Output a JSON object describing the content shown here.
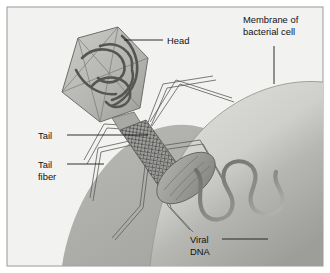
{
  "figure": {
    "background_color": "#f2f2f1",
    "border_color": "#9a9a98",
    "ink_color": "#111111"
  },
  "labels": {
    "head": "Head",
    "membrane_line1": "Membrane of",
    "membrane_line2": "bacterial cell",
    "tail": "Tail",
    "tail_fiber_line1": "Tail",
    "tail_fiber_line2": "fiber",
    "viral_dna_line1": "Viral",
    "viral_dna_line2": "DNA"
  },
  "parts": {
    "head_name": "icosahedral-capsid",
    "head_fill": "#b9b9b6",
    "head_edge": "#6d6d6a",
    "packed_dna_color": "#555553",
    "collar_name": "collar",
    "tail_sheath_name": "tail-sheath",
    "tail_sheath_fill": "#a6a6a3",
    "tail_mesh_color": "#3d3d3c",
    "baseplate_name": "baseplate",
    "baseplate_fill": "#9e9e9b",
    "tail_fiber_color": "#5c5c5a",
    "tail_fiber_count": 6,
    "membrane_name": "bacterial-cell-membrane",
    "membrane_light": "#d8d8d5",
    "membrane_shadow": "#a9a9a6",
    "viral_dna_color": "#6f6f6d",
    "leader_line_color": "#1a1a1a"
  }
}
